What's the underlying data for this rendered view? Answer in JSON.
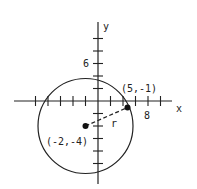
{
  "diagram": {
    "type": "circle-on-coordinate-plane",
    "axes": {
      "x_label": "x",
      "y_label": "y",
      "x_tick_label": "8",
      "y_tick_label": "6",
      "tick_interval_units": 2
    },
    "center": {
      "label": "(-2,-4)",
      "x": -2,
      "y": -4
    },
    "point_on_circle": {
      "label": "(5,-1)",
      "x": 5,
      "y": -1
    },
    "radius_label": "r",
    "colors": {
      "stroke": "#222222",
      "background": "#ffffff"
    }
  }
}
